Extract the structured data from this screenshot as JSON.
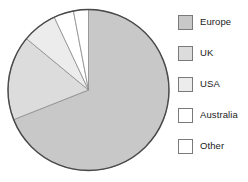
{
  "chart_data": {
    "type": "pie",
    "title": "",
    "legend_position": "right",
    "start_angle_deg": 0,
    "direction": "clockwise",
    "categories": [
      "Europe",
      "UK",
      "USA",
      "Australia",
      "Other"
    ],
    "values": [
      69,
      17,
      7,
      4,
      3
    ],
    "unit": "percent",
    "slices": [
      {
        "label": "Europe",
        "value": 69,
        "color": "#c8c8c8",
        "start_deg": 0,
        "end_deg": 248.4
      },
      {
        "label": "UK",
        "value": 17,
        "color": "#dcdcdc",
        "start_deg": 248.4,
        "end_deg": 309.6
      },
      {
        "label": "USA",
        "value": 7,
        "color": "#ececec",
        "start_deg": 309.6,
        "end_deg": 334.8
      },
      {
        "label": "Australia",
        "value": 4,
        "color": "#ffffff",
        "start_deg": 334.8,
        "end_deg": 349.2
      },
      {
        "label": "Other",
        "value": 3,
        "color": "#ffffff",
        "start_deg": 349.2,
        "end_deg": 360
      }
    ]
  },
  "legend": {
    "items": [
      {
        "label": "Europe",
        "color": "#c8c8c8"
      },
      {
        "label": "UK",
        "color": "#dcdcdc"
      },
      {
        "label": "USA",
        "color": "#ececec"
      },
      {
        "label": "Australia",
        "color": "#ffffff"
      },
      {
        "label": "Other",
        "color": "#ffffff"
      }
    ]
  },
  "style": {
    "outline_color": "#4a4a4a",
    "divider_color": "#8c8c8c",
    "legend_border": "#7a7a7a",
    "text_color": "#1b1b1b",
    "background": "#ffffff"
  },
  "geometry": {
    "center_x": 88.5,
    "center_y": 90,
    "radius": 80.5
  }
}
